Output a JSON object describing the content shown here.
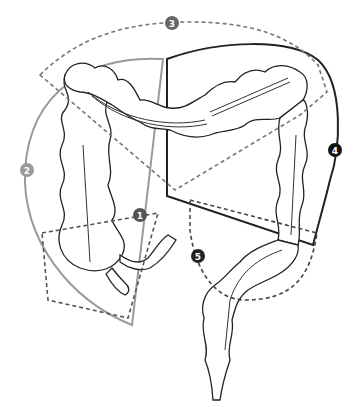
{
  "diagram": {
    "regions": [
      {
        "id": "1",
        "label": "1",
        "style": "dashed",
        "color": "#555555",
        "marker_color": "#555555"
      },
      {
        "id": "2",
        "label": "2",
        "style": "solid",
        "color": "#999999",
        "marker_color": "#999999"
      },
      {
        "id": "3",
        "label": "3",
        "style": "dashed",
        "color": "#777777",
        "marker_color": "#666666"
      },
      {
        "id": "4",
        "label": "4",
        "style": "solid",
        "color": "#222222",
        "marker_color": "#111111"
      },
      {
        "id": "5",
        "label": "5",
        "style": "dashed",
        "color": "#444444",
        "marker_color": "#222222"
      }
    ]
  }
}
